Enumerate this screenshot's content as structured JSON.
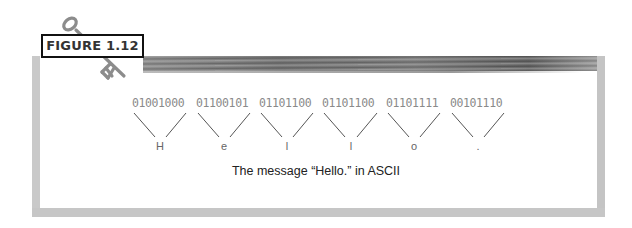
{
  "figure": {
    "label": "FIGURE 1.12",
    "caption": "The message “Hello.” in ASCII",
    "icon": "key-icon"
  },
  "encoding": [
    {
      "binary": "01001000",
      "char": "H"
    },
    {
      "binary": "01100101",
      "char": "e"
    },
    {
      "binary": "01101100",
      "char": "l"
    },
    {
      "binary": "01101100",
      "char": "l"
    },
    {
      "binary": "01101111",
      "char": "o"
    },
    {
      "binary": "00101110",
      "char": "."
    }
  ],
  "colors": {
    "frame": "#c6c6c6",
    "binary_text": "#8a8a8a",
    "label_border": "#111111"
  }
}
